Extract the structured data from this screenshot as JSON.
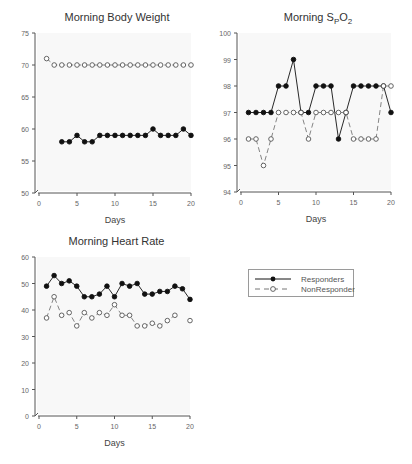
{
  "colors": {
    "background": "#ffffff",
    "plot_background": "#f8f8f8",
    "axis": "#555555",
    "tick_label": "#666666",
    "title": "#333333",
    "responders": "#111111",
    "nonresponders": "#777777"
  },
  "legend": {
    "items": [
      {
        "label": "Responders",
        "marker": "filled-circle",
        "line": "solid"
      },
      {
        "label": "NonResponders",
        "marker": "open-circle",
        "line": "dashed"
      }
    ]
  },
  "chart_data": [
    {
      "type": "line",
      "title": "Morning Body Weight",
      "xlabel": "Days",
      "ylabel": "",
      "xlim": [
        0,
        20
      ],
      "ylim": [
        50,
        75
      ],
      "xticks": [
        0,
        5,
        10,
        15,
        20
      ],
      "yticks": [
        50,
        55,
        60,
        65,
        70,
        75
      ],
      "grid": false,
      "legend_position": "separate panel, bottom right",
      "x": [
        1,
        2,
        3,
        4,
        5,
        6,
        7,
        8,
        9,
        10,
        11,
        12,
        13,
        14,
        15,
        16,
        17,
        18,
        19,
        20
      ],
      "series": [
        {
          "name": "Responders",
          "values": [
            null,
            null,
            58,
            58,
            59,
            58,
            58,
            59,
            59,
            59,
            59,
            59,
            59,
            59,
            60,
            59,
            59,
            59,
            60,
            59
          ]
        },
        {
          "name": "NonResponders",
          "values": [
            71,
            70,
            70,
            70,
            70,
            70,
            70,
            70,
            70,
            70,
            70,
            70,
            70,
            70,
            70,
            70,
            70,
            70,
            70,
            70
          ]
        }
      ]
    },
    {
      "type": "line",
      "title": "Morning SpO2",
      "title_parts": {
        "main": "Morning S",
        "sub1": "P",
        "mid": "O",
        "sub2": "2"
      },
      "xlabel": "Days",
      "ylabel": "",
      "xlim": [
        0,
        20
      ],
      "ylim": [
        94,
        100
      ],
      "xticks": [
        0,
        5,
        10,
        15,
        20
      ],
      "yticks": [
        94,
        95,
        96,
        97,
        98,
        99,
        100
      ],
      "grid": false,
      "x": [
        1,
        2,
        3,
        4,
        5,
        6,
        7,
        8,
        9,
        10,
        11,
        12,
        13,
        14,
        15,
        16,
        17,
        18,
        19,
        20
      ],
      "series": [
        {
          "name": "Responders",
          "values": [
            97,
            97,
            97,
            97,
            98,
            98,
            99,
            97,
            97,
            98,
            98,
            98,
            96,
            97,
            98,
            98,
            98,
            98,
            98,
            97
          ]
        },
        {
          "name": "NonResponders",
          "values": [
            96,
            96,
            95,
            96,
            97,
            97,
            97,
            97,
            96,
            97,
            97,
            97,
            97,
            97,
            96,
            96,
            96,
            96,
            98,
            98
          ]
        }
      ]
    },
    {
      "type": "line",
      "title": "Morning Heart Rate",
      "xlabel": "Days",
      "ylabel": "",
      "xlim": [
        0,
        20
      ],
      "ylim": [
        0,
        60
      ],
      "xticks": [
        0,
        5,
        10,
        15,
        20
      ],
      "yticks": [
        0,
        10,
        20,
        30,
        40,
        50,
        60
      ],
      "grid": false,
      "x": [
        1,
        2,
        3,
        4,
        5,
        6,
        7,
        8,
        9,
        10,
        11,
        12,
        13,
        14,
        15,
        16,
        17,
        18,
        19,
        20
      ],
      "series": [
        {
          "name": "Responders",
          "values": [
            49,
            53,
            50,
            51,
            49,
            45,
            45,
            46,
            49,
            45,
            50,
            49,
            50,
            46,
            46,
            47,
            47,
            49,
            48,
            44
          ]
        },
        {
          "name": "NonResponders",
          "values": [
            37,
            45,
            38,
            39,
            34,
            39,
            37,
            39,
            38,
            42,
            38,
            38,
            34,
            34,
            35,
            34,
            36,
            38,
            null,
            36
          ]
        }
      ]
    }
  ]
}
